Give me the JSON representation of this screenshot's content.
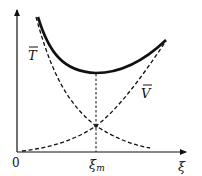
{
  "figure": {
    "type": "energy-vs-parameter sketch",
    "x_axis": {
      "label": "ξ",
      "origin_label": "0"
    },
    "marker": {
      "label_main": "ξ",
      "label_sub": "m",
      "meaning": "minimum of total"
    },
    "curves": [
      {
        "name": "T̄",
        "label": "T",
        "style": "dashed",
        "trend": "decreasing"
      },
      {
        "name": "V̄",
        "label": "V",
        "style": "dashed",
        "trend": "increasing"
      },
      {
        "name": "total",
        "label": "",
        "style": "solid-thick",
        "trend": "U-shaped with minimum at ξm"
      }
    ],
    "colors": {
      "ink": "#111111",
      "background": "#ffffff"
    }
  }
}
